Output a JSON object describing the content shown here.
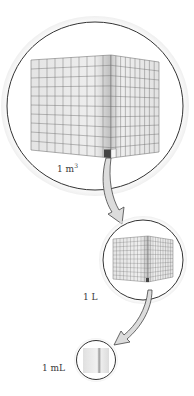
{
  "diagram": {
    "levels": [
      {
        "id": "cubic-meter",
        "label": "1 m",
        "superscript": "3",
        "grid": 10
      },
      {
        "id": "liter",
        "label": "1 L",
        "grid": 10
      },
      {
        "id": "milliliter",
        "label": "1 mL",
        "grid": 1
      }
    ],
    "arrows": [
      {
        "from": "cubic-meter",
        "to": "liter"
      },
      {
        "from": "liter",
        "to": "milliliter"
      }
    ],
    "colors": {
      "circle_stroke": "#333333",
      "cube_face": "#e6e6e6",
      "cube_grid": "#6e6e6e",
      "highlight_cell": "#444444",
      "arrow_fill": "#dcdcdc"
    }
  }
}
